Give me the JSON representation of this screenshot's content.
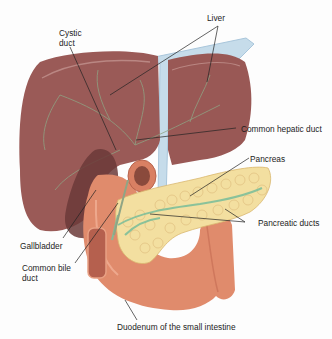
{
  "figure": {
    "type": "anatomical-diagram"
  },
  "labels": {
    "liver": "Liver",
    "cystic_duct": "Cystic\nduct",
    "common_hepatic_duct": "Common hepatic duct",
    "pancreas": "Pancreas",
    "pancreatic_ducts": "Pancreatic ducts",
    "gallbladder": "Gallbladder",
    "common_bile_duct": "Common bile\nduct",
    "duodenum": "Duodenum of the small intestine"
  },
  "colors": {
    "liver": "#9a5a57",
    "liver_shade": "#7f4644",
    "gallbladder": "#6b3a38",
    "ligament": "#b8d4e6",
    "pancreas": "#f3dfa0",
    "pancreas_lobule": "#e2c27a",
    "ducts": "#7fbf9a",
    "duodenum": "#e08b6c",
    "duodenum_shade": "#c86f55",
    "leader_line": "#222222"
  }
}
